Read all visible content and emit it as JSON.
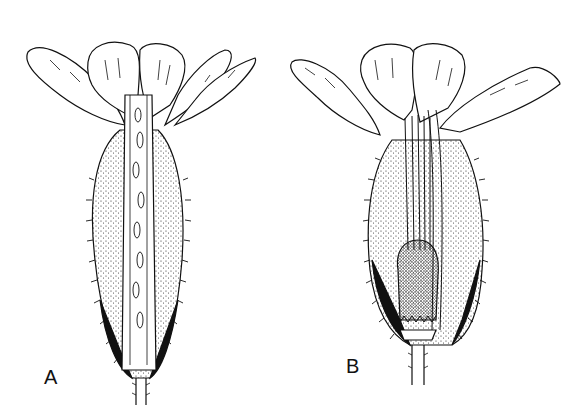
{
  "figure": {
    "type": "botanical line drawing",
    "panels": [
      {
        "id": "A",
        "label": "A",
        "description": "Longitudinal section of flower showing calyx tube with ovules and long style"
      },
      {
        "id": "B",
        "label": "B",
        "description": "Longitudinal section of flower showing calyx, stamens and swollen ovary at base"
      }
    ],
    "colors": {
      "ink": "#111111",
      "background": "#ffffff"
    }
  }
}
